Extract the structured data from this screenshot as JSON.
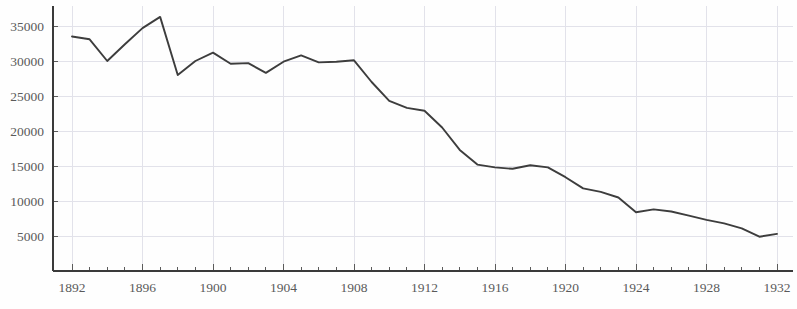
{
  "chart_data": {
    "type": "line",
    "title": "",
    "subtitle": "",
    "xlabel": "",
    "ylabel": "",
    "grid": true,
    "legend": null,
    "xlim": [
      1892,
      1932
    ],
    "ylim": [
      0,
      37500
    ],
    "yticks": [
      5000,
      10000,
      15000,
      20000,
      25000,
      30000,
      35000
    ],
    "ytick_labels": [
      "5000",
      "10000",
      "15000",
      "20000",
      "25000",
      "30000",
      "35000"
    ],
    "xticks": [
      1892,
      1896,
      1900,
      1904,
      1908,
      1912,
      1916,
      1920,
      1924,
      1928,
      1932
    ],
    "xtick_labels": [
      "1892",
      "1896",
      "1900",
      "1904",
      "1908",
      "1912",
      "1916",
      "1920",
      "1924",
      "1928",
      "1932"
    ],
    "xtick_minor_step": 1,
    "x": [
      1892,
      1893,
      1894,
      1895,
      1896,
      1897,
      1898,
      1899,
      1900,
      1901,
      1902,
      1903,
      1904,
      1905,
      1906,
      1907,
      1908,
      1909,
      1910,
      1911,
      1912,
      1913,
      1914,
      1915,
      1916,
      1917,
      1918,
      1919,
      1920,
      1921,
      1922,
      1923,
      1924,
      1925,
      1926,
      1927,
      1928,
      1929,
      1930,
      1931,
      1932
    ],
    "values": [
      33500,
      33100,
      30000,
      32400,
      34700,
      36300,
      28000,
      30000,
      31200,
      29600,
      29700,
      28300,
      29900,
      30800,
      29800,
      29900,
      30100,
      27000,
      24300,
      23300,
      22900,
      20500,
      17300,
      15200,
      14800,
      14600,
      15100,
      14800,
      13400,
      11800,
      11300,
      10500,
      8400,
      8800,
      8500,
      7900,
      7300,
      6800,
      6100,
      4900,
      5300
    ],
    "series_name": "",
    "line_color": "#3d3d3d",
    "grid_color": "#e2e2ea",
    "axis_color": "#3a3a3a",
    "tick_text_color": "#5a5a5a",
    "background_color": "#fefefe"
  },
  "layout": {
    "plot_left": 53,
    "plot_right": 793,
    "plot_top": 6,
    "plot_bottom": 271,
    "x_1892_px": 72,
    "x_1932_px": 777,
    "y_5000_px": 236,
    "y_35000_px": 26,
    "xtick_label_y": 292
  }
}
